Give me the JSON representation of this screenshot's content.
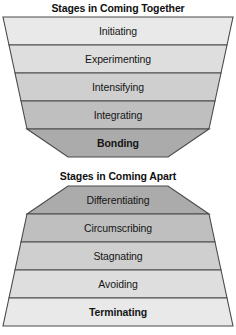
{
  "figure": {
    "background_color": "#ffffff",
    "outline_color": "#4a4a4a",
    "text_color": "#151515"
  },
  "coming_together": {
    "title": "Stages in Coming Together",
    "shape": "inverted-trapezoid-funnel",
    "stages": [
      {
        "label": "Initiating",
        "bold": false,
        "fill": "#e9e9e9"
      },
      {
        "label": "Experimenting",
        "bold": false,
        "fill": "#dedede"
      },
      {
        "label": "Intensifying",
        "bold": false,
        "fill": "#cfcfcf"
      },
      {
        "label": "Integrating",
        "bold": false,
        "fill": "#bfbfbf"
      },
      {
        "label": "Bonding",
        "bold": true,
        "fill": "#ababab"
      }
    ]
  },
  "coming_apart": {
    "title": "Stages in Coming Apart",
    "shape": "trapezoid-pyramid",
    "stages": [
      {
        "label": "Differentiating",
        "bold": false,
        "fill": "#ababab"
      },
      {
        "label": "Circumscribing",
        "bold": false,
        "fill": "#bfbfbf"
      },
      {
        "label": "Stagnating",
        "bold": false,
        "fill": "#cfcfcf"
      },
      {
        "label": "Avoiding",
        "bold": false,
        "fill": "#dedede"
      },
      {
        "label": "Terminating",
        "bold": true,
        "fill": "#e9e9e9"
      }
    ]
  }
}
